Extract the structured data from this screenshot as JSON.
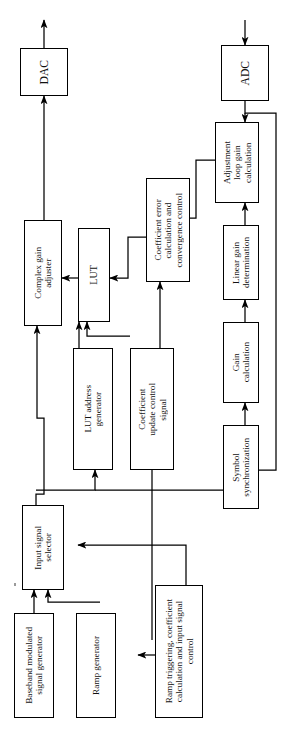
{
  "diagram": {
    "orientation": "rotated-90-ccw",
    "line_color": "#000000",
    "background_color": "#ffffff",
    "blocks": [
      {
        "id": "dac",
        "label": "DAC"
      },
      {
        "id": "adc",
        "label": "ADC"
      },
      {
        "id": "cga",
        "label": "Complex gain\nadjuster"
      },
      {
        "id": "lut",
        "label": "LUT"
      },
      {
        "id": "cecc",
        "label": "Coefficient error\ncalculation and\nconvergence control"
      },
      {
        "id": "algc",
        "label": "Adjustment\nloop gain\ncalculation"
      },
      {
        "id": "lgd",
        "label": "Linear gain\ndetermination"
      },
      {
        "id": "gaincalc",
        "label": "Gain\ncalculation"
      },
      {
        "id": "symsync",
        "label": "Symbol\nsynchronization"
      },
      {
        "id": "lutaddr",
        "label": "LUT address\ngenerator"
      },
      {
        "id": "cucs",
        "label": "Coefficient\nupdate control\nsignal"
      },
      {
        "id": "inpsel",
        "label": "Input signal\nselector"
      },
      {
        "id": "basegen",
        "label": "Baseband modulated\nsignal generator"
      },
      {
        "id": "rampgen",
        "label": "Ramp generator"
      },
      {
        "id": "rampctl",
        "label": "Ramp triggering, coefficient\ncalculation and input signal\ncontrol"
      }
    ],
    "connections": [
      {
        "from": "cga",
        "to": "dac"
      },
      {
        "from": "dac",
        "to": "rf-output"
      },
      {
        "from": "rf-input",
        "to": "adc"
      },
      {
        "from": "lut",
        "to": "cga"
      },
      {
        "from": "cecc",
        "to": "lut"
      },
      {
        "from": "lutaddr",
        "to": "lut"
      },
      {
        "from": "cucs",
        "to": "lut"
      },
      {
        "from": "cucs",
        "to": "cecc"
      },
      {
        "from": "lgd",
        "to": "cecc"
      },
      {
        "from": "algc",
        "to": "cecc"
      },
      {
        "from": "adc",
        "to": "algc"
      },
      {
        "from": "gaincalc",
        "to": "lgd"
      },
      {
        "from": "symsync",
        "to": "gaincalc"
      },
      {
        "from": "adc",
        "to": "symsync"
      },
      {
        "from": "inpsel",
        "to": "symsync"
      },
      {
        "from": "inpsel",
        "to": "cga"
      },
      {
        "from": "inpsel",
        "to": "lutaddr"
      },
      {
        "from": "basegen",
        "to": "inpsel"
      },
      {
        "from": "rampgen",
        "to": "inpsel"
      },
      {
        "from": "rampctl",
        "to": "inpsel"
      },
      {
        "from": "rampctl",
        "to": "rampgen"
      },
      {
        "from": "rampctl",
        "to": "cucs"
      }
    ]
  }
}
